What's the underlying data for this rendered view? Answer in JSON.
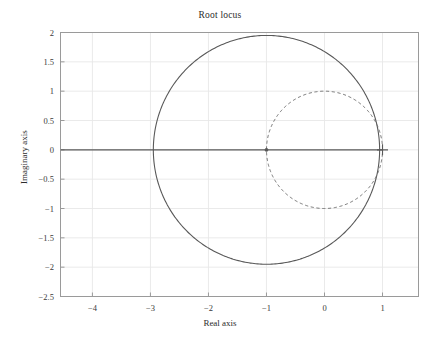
{
  "chart_data": {
    "type": "line",
    "title": "Root locus",
    "xlabel": "Real axis",
    "ylabel": "Imaginary axis",
    "xlim": [
      -4.55,
      1.62
    ],
    "ylim": [
      -2.5,
      2.0
    ],
    "xticks": [
      -4,
      -3,
      -2,
      -1,
      0,
      1
    ],
    "xticklabels": [
      "−4",
      "−3",
      "−2",
      "−1",
      "0",
      "1"
    ],
    "yticks": [
      -2.5,
      -2,
      -1.5,
      -1,
      -0.5,
      0,
      0.5,
      1,
      1.5,
      2
    ],
    "yticklabels": [
      "−2.5",
      "−2",
      "−1.5",
      "−1",
      "−0.5",
      "0",
      "0.5",
      "1",
      "1.5",
      "2"
    ],
    "grid": true,
    "grid_color": "#e8e8e8",
    "axes_color": "#9a9a9a",
    "legend": null,
    "series": [
      {
        "name": "root-locus-branch-circle",
        "style": "solid",
        "color": "#595959",
        "shape": "circle",
        "center": [
          -1.0,
          0.0
        ],
        "radius": 1.95
      },
      {
        "name": "unit-circle",
        "style": "dashed",
        "color": "#6e6e6e",
        "shape": "circle",
        "center": [
          0.0,
          0.0
        ],
        "radius": 1.0
      },
      {
        "name": "real-axis-branch",
        "style": "solid",
        "color": "#595959",
        "shape": "segment",
        "x": [
          -4.55,
          1.0
        ],
        "y": [
          0.0,
          0.0
        ]
      }
    ],
    "markers": [
      {
        "name": "pole-marker-plus",
        "glyph": "plus",
        "x": 1.0,
        "y": 0.0,
        "color": "#595959"
      },
      {
        "name": "breakaway-marker",
        "glyph": "dot",
        "x": -1.0,
        "y": 0.0,
        "color": "#595959"
      }
    ]
  }
}
